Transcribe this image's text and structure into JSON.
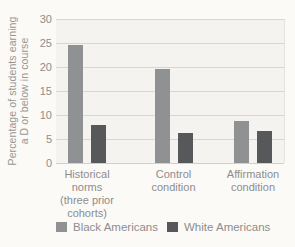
{
  "chart_data": {
    "type": "bar",
    "title": "",
    "ylabel": "Percentage of students earning a D or below in course",
    "ylabel_lines": [
      "Percentage of students earning",
      "a D or below in course"
    ],
    "xlabel": "",
    "ylim": [
      0,
      30
    ],
    "y_ticks": [
      30,
      25,
      20,
      15,
      10,
      5,
      0
    ],
    "grid": "horizontal",
    "legend_position": "bottom",
    "categories": [
      "Historical norms (three prior cohorts)",
      "Control condition",
      "Affirmation condition"
    ],
    "category_label_lines": [
      [
        "Historical",
        "norms",
        "(three prior",
        "cohorts)"
      ],
      [
        "Control",
        "condition"
      ],
      [
        "Affirmation",
        "condition"
      ]
    ],
    "series": [
      {
        "name": "Black Americans",
        "color": "#8f9193",
        "values": [
          24.5,
          19.5,
          8.7
        ]
      },
      {
        "name": "White Americans",
        "color": "#57585a",
        "values": [
          8.0,
          6.3,
          6.7
        ]
      }
    ]
  },
  "colors": {
    "page_background": "#fbfaf7",
    "plot_background": "#f4f3f0",
    "gridline": "#d9d6d1",
    "text": "#8d8d8d"
  }
}
